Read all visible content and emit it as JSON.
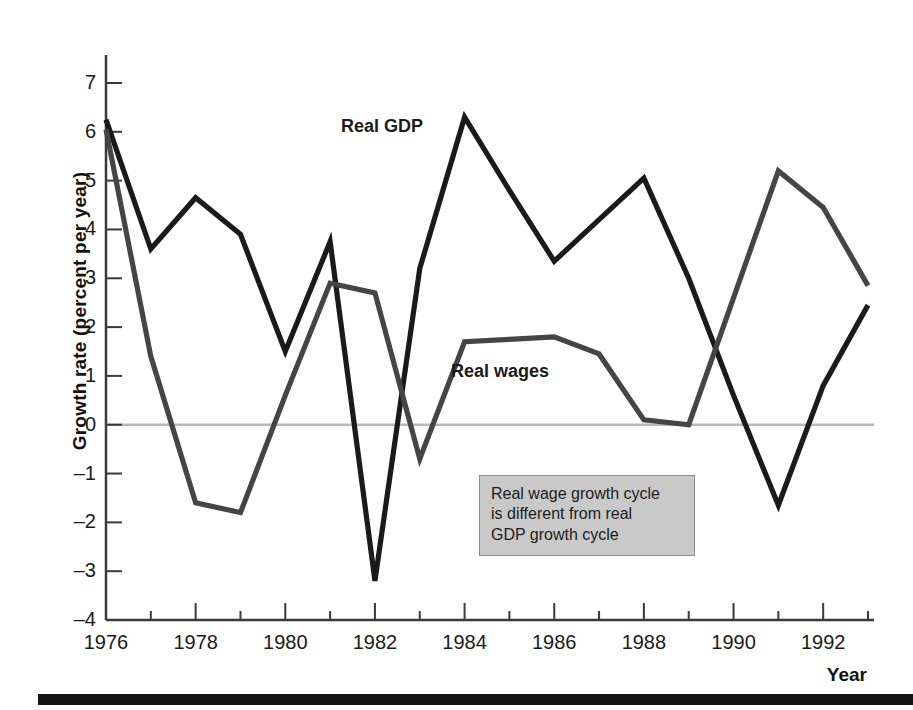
{
  "axes": {
    "y_title": "Growth rate (percent per year)",
    "x_title": "Year",
    "y_ticks": [
      7,
      6,
      5,
      4,
      3,
      2,
      1,
      0,
      -1,
      -2,
      -3,
      -4
    ],
    "y_tick_labels": [
      "7",
      "6",
      "5",
      "4",
      "3",
      "2",
      "1",
      "0",
      "–1",
      "–2",
      "–3",
      "–4"
    ],
    "x_tick_labels": [
      "1976",
      "1978",
      "1980",
      "1982",
      "1984",
      "1986",
      "1988",
      "1990",
      "1992"
    ],
    "x_tick_values": [
      1976,
      1978,
      1980,
      1982,
      1984,
      1986,
      1988,
      1990,
      1992
    ]
  },
  "labels": {
    "gdp": "Real GDP",
    "wages": "Real wages"
  },
  "annotation": {
    "line1": "Real wage growth cycle",
    "line2": "is different from real",
    "line3": "GDP growth cycle"
  },
  "colors": {
    "gdp_line": "#1a1a1a",
    "wages_line": "#454545",
    "zero_line": "#b9b9b9",
    "axis": "#3a3a3a",
    "annotation_fill": "#c9c9c9",
    "annotation_border": "#8d8d8d",
    "bottom_rule": "#131313"
  },
  "chart_data": {
    "type": "line",
    "title": "",
    "xlabel": "Year",
    "ylabel": "Growth rate (percent per year)",
    "xlim": [
      1976,
      1993
    ],
    "ylim": [
      -4,
      7
    ],
    "grid": false,
    "legend": "inline-labels",
    "x": [
      1976,
      1977,
      1978,
      1979,
      1980,
      1981,
      1982,
      1983,
      1984,
      1985,
      1986,
      1987,
      1988,
      1989,
      1990,
      1991,
      1992,
      1993
    ],
    "series": [
      {
        "name": "Real GDP",
        "color": "#1a1a1a",
        "values": [
          6.25,
          3.6,
          4.65,
          3.9,
          1.5,
          3.75,
          -3.2,
          3.2,
          6.3,
          4.8,
          3.35,
          4.2,
          5.05,
          3.0,
          0.6,
          -1.65,
          0.8,
          2.45
        ]
      },
      {
        "name": "Real wages",
        "color": "#454545",
        "values": [
          6.05,
          1.4,
          -1.6,
          -1.8,
          0.6,
          2.9,
          2.7,
          -0.7,
          1.7,
          1.75,
          1.8,
          1.45,
          0.1,
          0.0,
          2.6,
          5.2,
          4.45,
          2.85
        ]
      }
    ],
    "annotations": [
      {
        "text": "Real wage growth cycle is different from real GDP growth cycle",
        "x": 1986.3,
        "y": -1.4
      }
    ]
  }
}
